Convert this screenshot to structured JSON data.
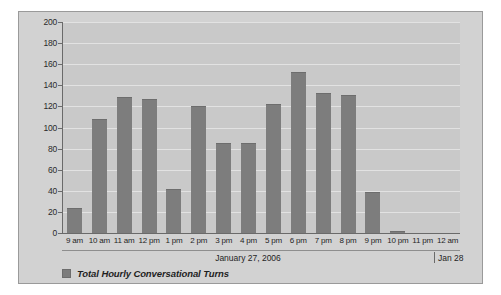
{
  "chart_data": {
    "type": "bar",
    "title": "",
    "xlabel": "January 27, 2006",
    "ylabel": "",
    "ylim": [
      0,
      200
    ],
    "ytick_step": 20,
    "grid": true,
    "legend_position": "bottom-left",
    "categories": [
      "9 am",
      "10 am",
      "11 am",
      "12 pm",
      "1 pm",
      "2 pm",
      "3 pm",
      "4 pm",
      "5 pm",
      "6 pm",
      "7 pm",
      "8 pm",
      "9 pm",
      "10 pm",
      "11 pm",
      "12 am"
    ],
    "values": [
      24,
      108,
      129,
      127,
      42,
      120,
      85,
      85,
      122,
      153,
      133,
      131,
      39,
      2,
      0,
      0
    ],
    "yticks": [
      "0",
      "20",
      "40",
      "60",
      "80",
      "100",
      "120",
      "140",
      "160",
      "180",
      "200"
    ],
    "series": [
      {
        "name": "Total Hourly Conversational Turns",
        "values": [
          24,
          108,
          129,
          127,
          42,
          120,
          85,
          85,
          122,
          153,
          133,
          131,
          39,
          2,
          0,
          0
        ],
        "color": "#7d7d7d"
      }
    ]
  },
  "legend": {
    "label": "Total Hourly Conversational Turns"
  },
  "date_axis": {
    "primary": "January 27, 2006",
    "secondary": "Jan 28"
  },
  "colors": {
    "bar": "#7d7d7d",
    "plot_background": "#c9c9c9",
    "panel_background": "#d2d2d2",
    "gridline": "#e2e2e2",
    "axis": "#6a6a6a",
    "text": "#1f1f1f"
  }
}
